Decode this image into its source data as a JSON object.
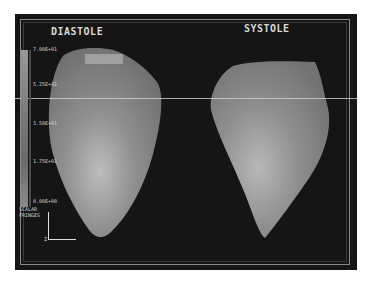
{
  "panels": {
    "left": {
      "label": "DIASTOLE"
    },
    "right": {
      "label": "SYSTOLE"
    }
  },
  "colorbar": {
    "title_line1": "SCALAR",
    "title_line2": "FRINGES",
    "ticks": [
      "7.00E+01",
      "5.25E+01",
      "3.50E+01",
      "1.75E+01",
      "0.00E+00"
    ]
  },
  "axes": {
    "z_label": "Z"
  },
  "colors": {
    "background": "#151515",
    "surface": "#9a9a9a",
    "text": "#d8d8d8"
  }
}
